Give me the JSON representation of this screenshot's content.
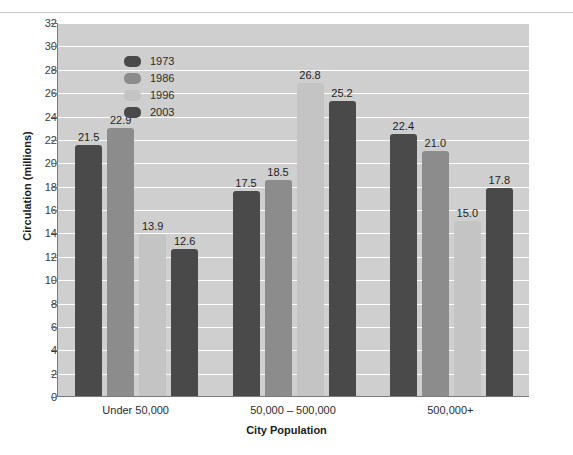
{
  "chart_data": {
    "type": "bar",
    "title": "",
    "xlabel": "City Population",
    "ylabel": "Circulation (millions)",
    "categories": [
      "Under 50,000",
      "50,000 – 500,000",
      "500,000+"
    ],
    "series": [
      {
        "name": "1973",
        "color": "#4a4a4a",
        "values": [
          21.5,
          17.5,
          22.4
        ]
      },
      {
        "name": "1986",
        "color": "#8c8c8c",
        "values": [
          22.9,
          18.5,
          21.0
        ]
      },
      {
        "name": "1996",
        "color": "#c4c4c4",
        "values": [
          13.9,
          26.8,
          15.0
        ]
      },
      {
        "name": "2003",
        "color": "#494949",
        "values": [
          12.6,
          25.2,
          17.8
        ]
      }
    ],
    "ylim": [
      0,
      32
    ],
    "ytick_step": 2,
    "ytick_labels": [
      "0",
      "2",
      "4",
      "6",
      "8",
      "10",
      "12",
      "14",
      "16",
      "18",
      "20",
      "22",
      "24",
      "26",
      "28",
      "30",
      "32"
    ],
    "grid": true,
    "grid_color": "#ffffff",
    "plot_background": "#cfcfcf",
    "figure_background": "#ffffff",
    "legend_position": "top-left",
    "data_labels": [
      [
        "21.5",
        "22.9",
        "13.9",
        "12.6"
      ],
      [
        "17.5",
        "18.5",
        "26.8",
        "25.2"
      ],
      [
        "22.4",
        "21.0",
        "15.0",
        "17.8"
      ]
    ]
  }
}
